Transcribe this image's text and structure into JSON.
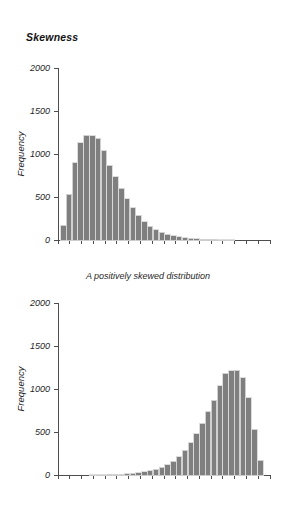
{
  "page": {
    "title": "Skewness"
  },
  "figures": [
    {
      "id": "positive",
      "caption": "A positively skewed distribution",
      "ylabel": "Frequency",
      "xlabel": "Score"
    },
    {
      "id": "negative",
      "caption": "",
      "ylabel": "Frequency",
      "xlabel": "Score"
    }
  ],
  "colors": {
    "bar_fill": "#7f7f7f",
    "bar_edge": "#d9d9d9",
    "axis": "#4d4d4d",
    "text": "#1f1f1f"
  },
  "chart_data": [
    {
      "type": "bar",
      "title": "A positively skewed distribution",
      "xlabel": "Score",
      "ylabel": "Frequency",
      "ylim": [
        0,
        2000
      ],
      "ytick_labels": [
        "0",
        "500",
        "1000",
        "1500",
        "2000"
      ],
      "ytick_values": [
        0,
        500,
        1000,
        1500,
        2000
      ],
      "xtick_labels": [],
      "xtick_count": 19,
      "grid": false,
      "legend": false,
      "categories": [
        1,
        2,
        3,
        4,
        5,
        6,
        7,
        8,
        9,
        10,
        11,
        12,
        13,
        14,
        15,
        16,
        17,
        18,
        19,
        20,
        21,
        22,
        23,
        24,
        25,
        26,
        27,
        28,
        29,
        30,
        31,
        32,
        33,
        34,
        35
      ],
      "values": [
        170,
        530,
        900,
        1130,
        1220,
        1210,
        1185,
        1040,
        870,
        735,
        600,
        480,
        375,
        290,
        215,
        160,
        120,
        90,
        65,
        48,
        35,
        25,
        18,
        14,
        10,
        8,
        6,
        5,
        4,
        3,
        2,
        2,
        1,
        1,
        1
      ]
    },
    {
      "type": "bar",
      "title": "A negatively skewed distribution",
      "xlabel": "Score",
      "ylabel": "Frequency",
      "ylim": [
        0,
        2000
      ],
      "ytick_labels": [
        "0",
        "500",
        "1000",
        "1500",
        "2000"
      ],
      "ytick_values": [
        0,
        500,
        1000,
        1500,
        2000
      ],
      "xtick_labels": [],
      "xtick_count": 19,
      "grid": false,
      "legend": false,
      "categories": [
        1,
        2,
        3,
        4,
        5,
        6,
        7,
        8,
        9,
        10,
        11,
        12,
        13,
        14,
        15,
        16,
        17,
        18,
        19,
        20,
        21,
        22,
        23,
        24,
        25,
        26,
        27,
        28,
        29,
        30,
        31,
        32,
        33,
        34,
        35
      ],
      "values": [
        1,
        1,
        1,
        2,
        2,
        3,
        4,
        5,
        6,
        8,
        10,
        14,
        18,
        25,
        35,
        48,
        65,
        90,
        120,
        160,
        215,
        290,
        375,
        480,
        600,
        735,
        870,
        1040,
        1185,
        1210,
        1220,
        1130,
        900,
        530,
        170
      ]
    }
  ]
}
